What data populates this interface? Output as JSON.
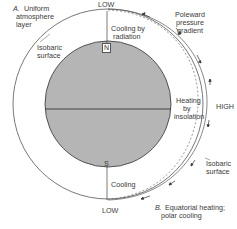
{
  "diagram": {
    "panel_a": {
      "letter": "A.",
      "title_line1": "Uniform",
      "title_line2": "atmosphere",
      "title_line3": "layer"
    },
    "panel_b": {
      "letter": "B.",
      "title_line1": "Equatorial heating;",
      "title_line2": "polar cooling"
    },
    "labels": {
      "low_top": "LOW",
      "low_bottom": "LOW",
      "high": "HIGH",
      "north": "N",
      "south": "S",
      "isobaric_left_1": "Isobaric",
      "isobaric_left_2": "surface",
      "isobaric_right_1": "Isobaric",
      "isobaric_right_2": "surface",
      "cooling_radiation_1": "Cooling by",
      "cooling_radiation_2": "radiation",
      "heating_1": "Heating",
      "heating_2": "by",
      "heating_3": "insolation",
      "cooling_bottom": "Cooling",
      "poleward_1": "Poleward",
      "poleward_2": "pressure",
      "poleward_3": "gradient"
    },
    "colors": {
      "earth_fill": "#b5b5b5",
      "line": "#444444",
      "background": "#ffffff"
    }
  }
}
